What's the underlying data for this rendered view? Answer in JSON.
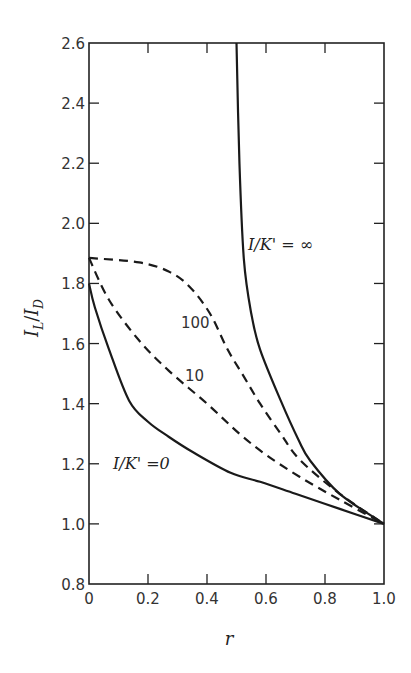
{
  "chart_data": {
    "type": "line",
    "title": "",
    "xlabel": "r",
    "ylabel": "I_L / I_D",
    "xlim": [
      0,
      1.0
    ],
    "ylim": [
      0.8,
      2.6
    ],
    "grid": false,
    "legend": "inline annotations",
    "x_ticks": [
      "0",
      "0.2",
      "0.4",
      "0.6",
      "0.8",
      "1.0"
    ],
    "y_ticks": [
      "0.8",
      "1.0",
      "1.2",
      "1.4",
      "1.6",
      "1.8",
      "2.0",
      "2.2",
      "2.4",
      "2.6"
    ],
    "series": [
      {
        "name": "I/K' = 0",
        "style": "solid",
        "points": [
          [
            0,
            1.8
          ],
          [
            0.02,
            1.72
          ],
          [
            0.068,
            1.58
          ],
          [
            0.136,
            1.41
          ],
          [
            0.2,
            1.34
          ],
          [
            0.27,
            1.29
          ],
          [
            0.35,
            1.24
          ],
          [
            0.48,
            1.17
          ],
          [
            0.58,
            1.14
          ],
          [
            0.7,
            1.1
          ],
          [
            0.85,
            1.05
          ],
          [
            1.0,
            1.0
          ]
        ]
      },
      {
        "name": "10",
        "style": "dashed",
        "points": [
          [
            0,
            1.885
          ],
          [
            0.068,
            1.745
          ],
          [
            0.17,
            1.61
          ],
          [
            0.27,
            1.51
          ],
          [
            0.4,
            1.4
          ],
          [
            0.51,
            1.3
          ],
          [
            0.6,
            1.23
          ],
          [
            0.715,
            1.156
          ],
          [
            0.85,
            1.08
          ],
          [
            1.0,
            1.0
          ]
        ]
      },
      {
        "name": "100",
        "style": "dashed",
        "points": [
          [
            0,
            1.885
          ],
          [
            0.17,
            1.87
          ],
          [
            0.27,
            1.84
          ],
          [
            0.34,
            1.79
          ],
          [
            0.41,
            1.7
          ],
          [
            0.47,
            1.58
          ],
          [
            0.525,
            1.49
          ],
          [
            0.58,
            1.4
          ],
          [
            0.65,
            1.3
          ],
          [
            0.715,
            1.213
          ],
          [
            0.85,
            1.1
          ],
          [
            1.0,
            1.0
          ]
        ]
      },
      {
        "name": "I/K' = ∞",
        "style": "solid",
        "points": [
          [
            0.5,
            2.6
          ],
          [
            0.51,
            2.2
          ],
          [
            0.525,
            1.88
          ],
          [
            0.55,
            1.7
          ],
          [
            0.58,
            1.58
          ],
          [
            0.65,
            1.41
          ],
          [
            0.71,
            1.28
          ],
          [
            0.75,
            1.21
          ],
          [
            0.85,
            1.1
          ],
          [
            1.0,
            1.0
          ]
        ]
      }
    ],
    "annotations": [
      {
        "text": "I/K' = ∞",
        "x": 0.6,
        "y": 1.96
      },
      {
        "text": "100",
        "x": 0.33,
        "y": 1.67
      },
      {
        "text": "10",
        "x": 0.34,
        "y": 1.49
      },
      {
        "text": "I/K' =0",
        "x": 0.1,
        "y": 1.2
      }
    ]
  },
  "labels": {
    "ylabel_main": "I",
    "ylabel_sub1": "L",
    "ylabel_slash": "/",
    "ylabel_main2": "I",
    "ylabel_sub2": "D",
    "xlabel": "r",
    "anno_inf": "I/K' = ∞",
    "anno_100": "100",
    "anno_10": "10",
    "anno_0": "I/K' =0"
  }
}
